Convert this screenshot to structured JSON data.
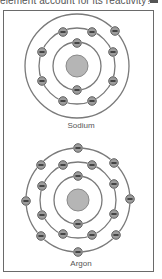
{
  "question": {
    "text": "element account for its reactivity?"
  },
  "colors": {
    "orbit": "#7a7a7a",
    "nucleus_fill": "#b5b5b5",
    "nucleus_stroke": "#8a8a8a",
    "electron_fill": "#9c9c9c",
    "electron_stroke": "#555555",
    "minus": "#222222",
    "frame": "#6a6a6a"
  },
  "atoms": [
    {
      "name": "Sodium",
      "center": [
        77,
        66
      ],
      "nucleus_radius": 11,
      "shells": [
        {
          "radius": 24,
          "electrons": [
            [
              77,
              43
            ],
            [
              77,
              90
            ]
          ]
        },
        {
          "radius": 38,
          "electrons": [
            [
              63,
              32
            ],
            [
              92,
              32
            ],
            [
              42,
              52
            ],
            [
              113,
              52
            ],
            [
              42,
              81
            ],
            [
              113,
              81
            ],
            [
              63,
              101
            ],
            [
              92,
              101
            ]
          ]
        },
        {
          "radius": 52,
          "electrons": [
            [
              115,
              31
            ]
          ]
        }
      ]
    },
    {
      "name": "Argon",
      "center": [
        78,
        200
      ],
      "nucleus_radius": 11,
      "shells": [
        {
          "radius": 24,
          "electrons": [
            [
              78,
              176
            ],
            [
              78,
              224
            ]
          ]
        },
        {
          "radius": 38,
          "electrons": [
            [
              63,
              165
            ],
            [
              92,
              165
            ],
            [
              42,
              186
            ],
            [
              114,
              184
            ],
            [
              42,
              215
            ],
            [
              114,
              214
            ],
            [
              63,
              234
            ],
            [
              92,
              235
            ]
          ]
        },
        {
          "radius": 52,
          "electrons": [
            [
              78,
              148
            ],
            [
              41,
              165
            ],
            [
              114,
              163
            ],
            [
              26,
              201
            ],
            [
              130,
              199
            ],
            [
              41,
              236
            ],
            [
              116,
              235
            ],
            [
              78,
              252
            ]
          ]
        }
      ]
    }
  ],
  "labels": {
    "sodium": "Sodium",
    "argon": "Argon"
  }
}
